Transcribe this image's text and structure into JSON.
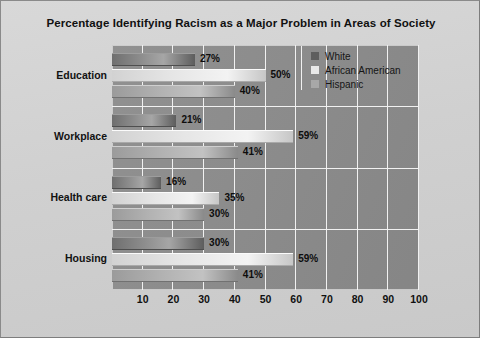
{
  "chart_data": {
    "type": "bar",
    "orientation": "horizontal",
    "title": "Percentage Identifying Racism as a Major Problem in Areas of Society",
    "xlabel": "",
    "ylabel": "",
    "xlim": [
      0,
      100
    ],
    "xticks": [
      10,
      20,
      30,
      40,
      50,
      60,
      70,
      80,
      90,
      100
    ],
    "grid": true,
    "legend_position": "top-right",
    "categories": [
      "Education",
      "Workplace",
      "Health care",
      "Housing"
    ],
    "series": [
      {
        "name": "White",
        "color": "#5e5e5e",
        "values": [
          27,
          21,
          16,
          30
        ],
        "labels": [
          "27%",
          "21%",
          "16%",
          "30%"
        ]
      },
      {
        "name": "African American",
        "color": "#e9e9e9",
        "values": [
          50,
          59,
          35,
          59
        ],
        "labels": [
          "50%",
          "59%",
          "35%",
          "59%"
        ]
      },
      {
        "name": "Hispanic",
        "color": "#a8a8a8",
        "values": [
          40,
          41,
          30,
          41
        ],
        "labels": [
          "40%",
          "41%",
          "30%",
          "41%"
        ]
      }
    ]
  },
  "legend": {
    "items": [
      {
        "label": "White",
        "swatch": "s-white"
      },
      {
        "label": "African American",
        "swatch": "s-african"
      },
      {
        "label": "Hispanic",
        "swatch": "s-hispanic"
      }
    ]
  }
}
